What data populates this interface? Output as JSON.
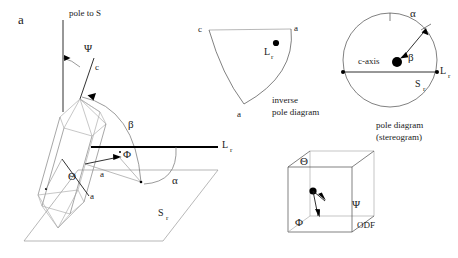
{
  "figure": {
    "panel_letter": "a",
    "caption_summary": "Crystal orientation angles relative to reference line Lr and reference plane Sr, shown as a 3D crystal sketch, an inverse pole diagram, a pole diagram (stereogram), and an orientation distribution function cube."
  },
  "crystal_panel": {
    "pole_label": "pole to S",
    "psi_label": "Ψ",
    "c_axis_label": "c",
    "beta_label": "β",
    "phi_label": "Φ",
    "a_axis_label_upper": "a",
    "a_axis_label_lower": "a",
    "theta_label": "Θ",
    "alpha_label": "α",
    "lr_label": "L",
    "lr_sub": "r",
    "plane_label": "S",
    "plane_sub": "r"
  },
  "inverse_pole_panel": {
    "vertex_c": "c",
    "vertex_a_top": "a",
    "vertex_a_bottom": "a",
    "point_label": "L",
    "point_sub": "r",
    "title_line1": "inverse",
    "title_line2": "pole diagram"
  },
  "pole_panel": {
    "alpha_label": "α",
    "beta_label": "β",
    "c_axis_label": "c-axis",
    "lr_label": "L",
    "lr_sub": "r",
    "plane_label": "S",
    "plane_sub": "r",
    "title_line1": "pole diagram",
    "title_line2": "(stereogram)"
  },
  "odf_panel": {
    "theta_label": "Θ",
    "psi_label": "Ψ",
    "phi_label": "Φ",
    "odf_label": "ODF"
  },
  "colors": {
    "background": "#ffffff",
    "ink": "#1a1a1a",
    "faint_line": "#9a9a9a",
    "arc_line": "#6f6f6f",
    "heavy_line": "#000000",
    "crystal_line": "#a8a8a8"
  }
}
